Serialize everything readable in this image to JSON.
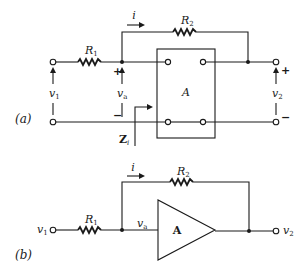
{
  "figure": {
    "panel_a": {
      "caption": "(a)",
      "input_label": "v",
      "input_sub": "1",
      "output_label": "v",
      "output_sub": "2",
      "node_label": "v",
      "node_sub": "a",
      "current_label": "i",
      "r1_label": "R",
      "r1_sub": "1",
      "r2_label": "R",
      "r2_sub": "2",
      "block_label": "A",
      "impedance_label": "Z",
      "impedance_sub": "i",
      "plus_sign": "+",
      "minus_sign": "−"
    },
    "panel_b": {
      "caption": "(b)",
      "input_label": "v",
      "input_sub": "1",
      "output_label": "v",
      "output_sub": "2",
      "node_label": "v",
      "node_sub": "a",
      "current_label": "i",
      "r1_label": "R",
      "r1_sub": "1",
      "r2_label": "R",
      "r2_sub": "2",
      "amp_label": "A"
    }
  }
}
